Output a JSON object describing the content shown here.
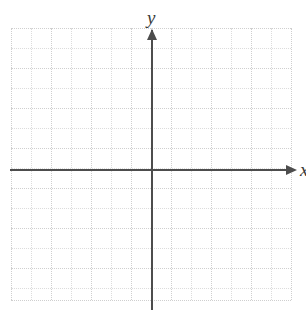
{
  "figure": {
    "kind": "cartesian-coordinate-plane",
    "width": 306,
    "height": 310,
    "background_color": "#ffffff"
  },
  "axes": {
    "x_axis": {
      "label": "x",
      "color": "#4d4d4d",
      "thickness_px": 2,
      "screen_y": 169,
      "start_x": 10,
      "end_x": 288,
      "has_arrow": true,
      "arrow_direction": "right"
    },
    "y_axis": {
      "label": "y",
      "color": "#4d4d4d",
      "thickness_px": 2,
      "screen_x": 151,
      "start_y": 310,
      "end_y": 30,
      "has_arrow": true,
      "arrow_direction": "up"
    }
  },
  "grid": {
    "visible": true,
    "style": "dotted",
    "minor_color": "#dcdcdc",
    "major_color": "#cfcfcf",
    "spacing_px": 20,
    "left": 11,
    "right": 291,
    "top": 28,
    "bottom": 300,
    "columns": 14,
    "rows": 14,
    "vertical_positions": [
      11,
      31,
      51,
      71,
      91,
      111,
      131,
      151,
      171,
      191,
      211,
      231,
      251,
      271,
      291
    ],
    "horizontal_positions": [
      28,
      48,
      68,
      88,
      108,
      128,
      148,
      168,
      188,
      208,
      228,
      248,
      268,
      288,
      300
    ]
  },
  "chart_data": {
    "type": "scatter",
    "title": "",
    "xlabel": "x",
    "ylabel": "y",
    "series": [
      {
        "name": "empty",
        "x": [],
        "y": []
      }
    ],
    "xlim": [
      -7,
      7
    ],
    "ylim": [
      -6.5,
      7
    ],
    "grid": true,
    "legend": "none",
    "annotations": [],
    "note": "Blank dotted-grid coordinate plane with labeled x and y axes; no data plotted."
  }
}
